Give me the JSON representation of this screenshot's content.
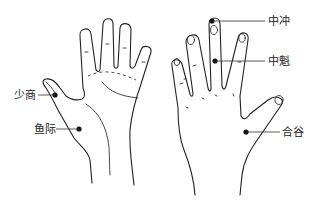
{
  "figure": {
    "left_hand": {
      "description": "palm view",
      "points": [
        {
          "label": "少商"
        },
        {
          "label": "鱼际"
        }
      ]
    },
    "right_hand": {
      "description": "back view",
      "points": [
        {
          "label": "中冲"
        },
        {
          "label": "中魁"
        },
        {
          "label": "合谷"
        }
      ]
    },
    "colors": {
      "line": "#222222",
      "point": "#111111",
      "background": "#ffffff"
    }
  }
}
